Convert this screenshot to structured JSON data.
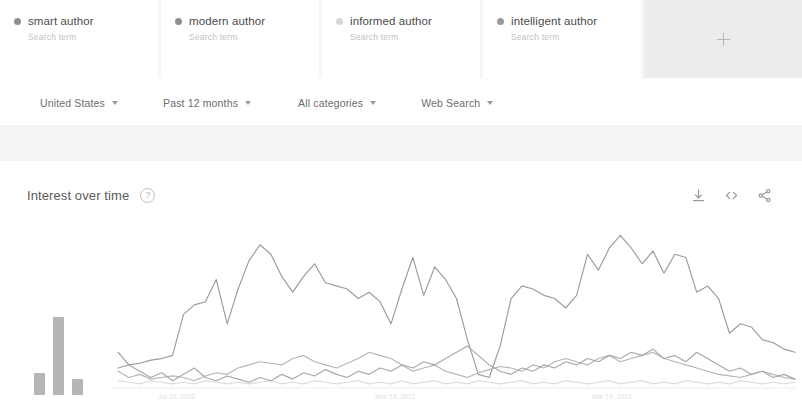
{
  "terms": [
    {
      "label": "smart author",
      "sub": "Search term",
      "color": "#8f8f8f"
    },
    {
      "label": "modern author",
      "sub": "Search term",
      "color": "#8f8f8f"
    },
    {
      "label": "informed author",
      "sub": "Search term",
      "color": "#d8d8d8"
    },
    {
      "label": "intelligent author",
      "sub": "Search term",
      "color": "#9a9a9a"
    }
  ],
  "compare": {
    "icon": "plus-icon",
    "label": ""
  },
  "filters": [
    {
      "label": "United States"
    },
    {
      "label": "Past 12 months"
    },
    {
      "label": "All categories"
    },
    {
      "label": "Web Search"
    }
  ],
  "chart_panel": {
    "title": "Interest over time",
    "help_icon": "?",
    "actions": [
      {
        "name": "download-icon"
      },
      {
        "name": "embed-code-icon"
      },
      {
        "name": "share-icon"
      }
    ]
  },
  "chart_data": {
    "type": "line",
    "title": "Interest over time",
    "xlabel": "",
    "ylabel": "",
    "ylim": [
      0,
      100
    ],
    "grid": false,
    "legend": "top-cards",
    "x_tick_labels": [
      "Jul 10, 2022",
      "Nov 13, 2022",
      "Mar 19, 2023"
    ],
    "x_tick_positions": [
      0.06,
      0.38,
      0.7
    ],
    "series": [
      {
        "name": "smart author",
        "color": "#9b9b9b",
        "values": [
          22,
          14,
          15,
          17,
          18,
          20,
          46,
          52,
          54,
          68,
          40,
          62,
          80,
          90,
          84,
          70,
          60,
          70,
          78,
          66,
          64,
          62,
          56,
          60,
          54,
          40,
          62,
          82,
          58,
          76,
          68,
          56,
          30,
          8,
          6,
          26,
          56,
          64,
          62,
          58,
          56,
          50,
          58,
          84,
          74,
          88,
          96,
          88,
          78,
          86,
          72,
          84,
          82,
          60,
          64,
          56,
          34,
          40,
          38,
          30,
          28,
          24,
          22
        ]
      },
      {
        "name": "modern author",
        "color": "#b5b5b5",
        "values": [
          10,
          6,
          8,
          5,
          6,
          7,
          6,
          4,
          7,
          9,
          8,
          12,
          14,
          16,
          15,
          14,
          18,
          20,
          16,
          14,
          12,
          15,
          18,
          22,
          20,
          18,
          14,
          10,
          12,
          14,
          10,
          8,
          6,
          9,
          11,
          13,
          12,
          10,
          14,
          12,
          16,
          18,
          16,
          14,
          18,
          20,
          16,
          18,
          20,
          22,
          18,
          16,
          14,
          12,
          10,
          8,
          7,
          6,
          8,
          10,
          8,
          6,
          5
        ]
      },
      {
        "name": "informed author",
        "color": "#dcdcdc",
        "values": [
          4,
          3,
          2,
          4,
          3,
          2,
          3,
          2,
          4,
          3,
          2,
          3,
          2,
          3,
          4,
          2,
          3,
          2,
          4,
          3,
          2,
          3,
          4,
          2,
          3,
          2,
          4,
          2,
          3,
          4,
          2,
          3,
          2,
          4,
          3,
          2,
          3,
          4,
          2,
          3,
          2,
          4,
          3,
          2,
          3,
          4,
          2,
          3,
          4,
          2,
          3,
          2,
          4,
          3,
          2,
          3,
          2,
          4,
          3,
          2,
          3,
          2,
          3
        ]
      },
      {
        "name": "intelligent author",
        "color": "#a8a8a8",
        "values": [
          12,
          14,
          10,
          6,
          9,
          4,
          8,
          12,
          6,
          4,
          7,
          5,
          3,
          6,
          4,
          8,
          5,
          9,
          7,
          11,
          8,
          6,
          10,
          8,
          12,
          10,
          14,
          12,
          16,
          14,
          18,
          22,
          26,
          20,
          14,
          10,
          8,
          12,
          10,
          14,
          12,
          16,
          14,
          18,
          16,
          20,
          18,
          22,
          20,
          24,
          18,
          20,
          16,
          22,
          18,
          14,
          10,
          12,
          8,
          10,
          6,
          8,
          5
        ]
      }
    ],
    "mini_bars": {
      "type": "bar",
      "values": [
        22,
        78,
        16
      ],
      "color": "#9e9e9e"
    }
  }
}
